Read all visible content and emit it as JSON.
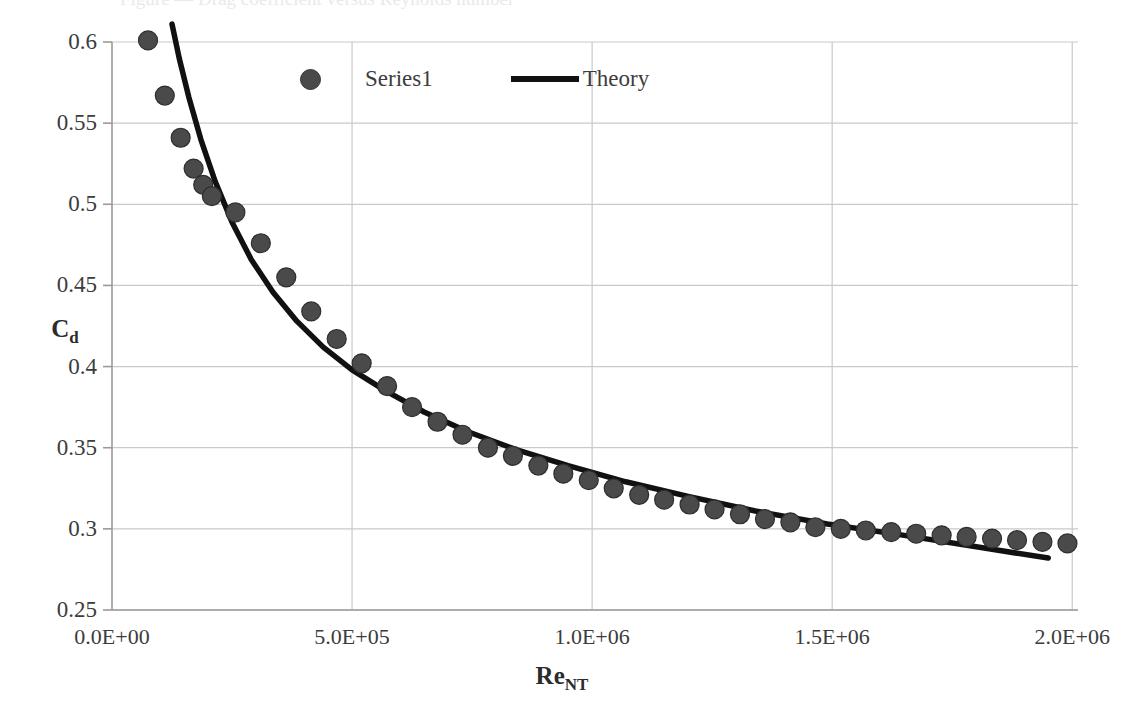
{
  "caption_remnant": "Figure — Drag coefficient versus Reynolds number",
  "axes": {
    "y_title_main": "C",
    "y_title_sub": "d",
    "x_title_main": "Re",
    "x_title_sub": "NT",
    "y_ticks": [
      "0.25",
      "0.3",
      "0.35",
      "0.4",
      "0.45",
      "0.5",
      "0.55",
      "0.6"
    ],
    "x_ticks": [
      "0.0E+00",
      "5.0E+05",
      "1.0E+06",
      "1.5E+06",
      "2.0E+06"
    ]
  },
  "legend": {
    "series_label": "Series1",
    "theory_label": "Theory",
    "marker_color": "#4a4a4a",
    "line_color": "#111111"
  },
  "chart_data": {
    "type": "scatter",
    "title": "",
    "xlabel": "Re_NT",
    "ylabel": "C_d",
    "xlim": [
      0,
      2010000
    ],
    "ylim": [
      0.25,
      0.6
    ],
    "xticks": [
      0,
      500000,
      1000000,
      1500000,
      2000000
    ],
    "yticks": [
      0.25,
      0.3,
      0.35,
      0.4,
      0.45,
      0.5,
      0.55,
      0.6
    ],
    "grid": true,
    "legend_position": "top-center",
    "series": [
      {
        "name": "Series1",
        "type": "scatter",
        "marker": "circle",
        "color": "#4a4a4a",
        "x": [
          75000,
          110000,
          143000,
          170000,
          190000,
          208000,
          257000,
          310000,
          363000,
          415000,
          468000,
          520000,
          573000,
          625000,
          678000,
          730000,
          783000,
          835000,
          888000,
          940000,
          993000,
          1045000,
          1098000,
          1150000,
          1203000,
          1255000,
          1308000,
          1360000,
          1413000,
          1465000,
          1518000,
          1570000,
          1623000,
          1675000,
          1728000,
          1780000,
          1833000,
          1885000,
          1938000,
          1990000
        ],
        "y": [
          0.601,
          0.567,
          0.541,
          0.522,
          0.512,
          0.505,
          0.495,
          0.476,
          0.455,
          0.434,
          0.417,
          0.402,
          0.388,
          0.375,
          0.366,
          0.358,
          0.35,
          0.345,
          0.339,
          0.334,
          0.33,
          0.325,
          0.321,
          0.318,
          0.315,
          0.312,
          0.309,
          0.306,
          0.304,
          0.301,
          0.3,
          0.299,
          0.298,
          0.297,
          0.296,
          0.295,
          0.294,
          0.293,
          0.292,
          0.291
        ]
      },
      {
        "name": "Theory",
        "type": "line",
        "color": "#111111",
        "x": [
          125000,
          140000,
          160000,
          185000,
          215000,
          250000,
          290000,
          335000,
          385000,
          440000,
          500000,
          570000,
          650000,
          740000,
          840000,
          950000,
          1070000,
          1200000,
          1340000,
          1490000,
          1650000,
          1820000,
          1950000
        ],
        "y": [
          0.611,
          0.59,
          0.566,
          0.54,
          0.514,
          0.489,
          0.466,
          0.446,
          0.428,
          0.412,
          0.398,
          0.385,
          0.372,
          0.36,
          0.349,
          0.339,
          0.329,
          0.32,
          0.311,
          0.303,
          0.296,
          0.288,
          0.282
        ]
      }
    ]
  },
  "plot_geometry": {
    "left": 112,
    "right": 1078,
    "top": 42,
    "bottom": 610,
    "x_min": 0,
    "x_max": 2012000,
    "y_min": 0.25,
    "y_max": 0.6,
    "grid_color": "#c9c9c9",
    "axis_color": "#9a9a9a",
    "background": "#ffffff"
  }
}
